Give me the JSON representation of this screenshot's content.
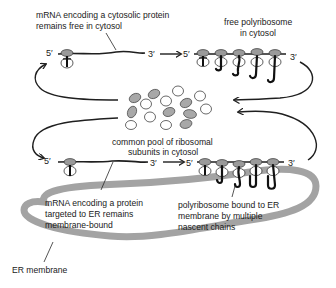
{
  "diagram": {
    "labels": {
      "cytosolic_mrna": [
        "mRNA encoding a cytosolic protein",
        "remains free in cytosol"
      ],
      "free_polyribosome": [
        "free polyribosome",
        "in cytosol"
      ],
      "common_pool": [
        "common pool of ribosomal",
        "subunits in cytosol"
      ],
      "er_mrna": [
        "mRNA encoding a protein",
        "targeted to ER remains",
        "membrane-bound"
      ],
      "bound_polyribosome": [
        "polyribosome bound to ER",
        "membrane by multiple",
        "nascent chains"
      ],
      "er_membrane": "ER membrane"
    },
    "ends": {
      "five_prime": "5′",
      "three_prime": "3′"
    },
    "colors": {
      "membrane": "#a3a3a3",
      "large_subunit": "#9a9a9a",
      "small_subunit": "#ffffff",
      "line": "#1f1f1f"
    },
    "pathways": [
      {
        "name": "cytosolic",
        "stage_1": "mRNA with single ribosome",
        "stage_2": "free polyribosome",
        "ribosomes_in_polysome": 5
      },
      {
        "name": "er-bound",
        "stage_1": "mRNA with single ribosome at ER",
        "stage_2": "ER-bound polyribosome",
        "ribosomes_in_polysome": 5
      }
    ],
    "pool": {
      "grey_subunits": 7,
      "white_subunits": 8
    }
  }
}
